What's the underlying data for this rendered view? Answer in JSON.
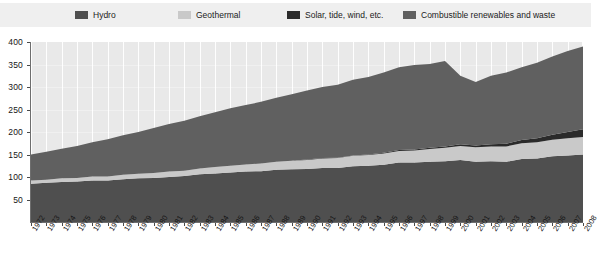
{
  "legend": {
    "items": [
      {
        "label": "Hydro",
        "color": "#4f4f4f",
        "swatch_name": "legend-swatch-hydro"
      },
      {
        "label": "Geothermal",
        "color": "#c9c9c9",
        "swatch_name": "legend-swatch-geothermal"
      },
      {
        "label": "Solar, tide, wind, etc.",
        "color": "#2b2b2b",
        "swatch_name": "legend-swatch-solar"
      },
      {
        "label": "Combustible renewables and waste",
        "color": "#606060",
        "swatch_name": "legend-swatch-combustible"
      }
    ]
  },
  "chart_data": {
    "type": "area",
    "title": "",
    "xlabel": "",
    "ylabel": "",
    "ylim": [
      0,
      400
    ],
    "yticks": [
      0,
      50,
      100,
      150,
      200,
      250,
      300,
      350,
      400
    ],
    "ytick_labels": [
      "",
      "50",
      "100",
      "150",
      "200",
      "250",
      "300",
      "350",
      "400"
    ],
    "grid": true,
    "legend_position": "top",
    "stacked": true,
    "categories": [
      "1972",
      "1973",
      "1974",
      "1975",
      "1976",
      "1977",
      "1978",
      "1979",
      "1980",
      "1981",
      "1982",
      "1983",
      "1984",
      "1985",
      "1986",
      "1987",
      "1988",
      "1989",
      "1990",
      "1991",
      "1992",
      "1993",
      "1994",
      "1995",
      "1996",
      "1997",
      "1998",
      "1999",
      "2000",
      "2001",
      "2002",
      "2003",
      "2004",
      "2005",
      "2006",
      "2007",
      "2008"
    ],
    "series": [
      {
        "name": "Hydro",
        "color": "#4f4f4f",
        "values": [
          85,
          87,
          89,
          90,
          92,
          92,
          95,
          97,
          98,
          100,
          102,
          106,
          108,
          110,
          112,
          113,
          116,
          117,
          118,
          120,
          120,
          124,
          125,
          127,
          132,
          132,
          134,
          135,
          138,
          134,
          135,
          134,
          140,
          141,
          146,
          148,
          150
        ]
      },
      {
        "name": "Geothermal",
        "color": "#c9c9c9",
        "values": [
          7,
          7,
          8,
          8,
          9,
          9,
          10,
          10,
          11,
          12,
          12,
          13,
          14,
          15,
          16,
          17,
          18,
          19,
          20,
          21,
          22,
          23,
          24,
          25,
          26,
          27,
          28,
          30,
          31,
          32,
          33,
          34,
          35,
          36,
          37,
          38,
          39
        ]
      },
      {
        "name": "Solar, tide, wind, etc.",
        "color": "#2b2b2b",
        "values": [
          0,
          0,
          0,
          0,
          0,
          0,
          0,
          0,
          0,
          0,
          0,
          0,
          0,
          0,
          0,
          0,
          0,
          0,
          1,
          1,
          1,
          1,
          1,
          2,
          2,
          2,
          3,
          3,
          4,
          4,
          5,
          6,
          7,
          9,
          11,
          14,
          17
        ]
      },
      {
        "name": "Combustible renewables and waste",
        "color": "#606060",
        "values": [
          58,
          62,
          66,
          71,
          76,
          83,
          88,
          93,
          100,
          106,
          111,
          116,
          122,
          128,
          132,
          137,
          142,
          148,
          153,
          158,
          162,
          168,
          172,
          178,
          184,
          188,
          186,
          190,
          152,
          141,
          152,
          158,
          162,
          168,
          174,
          180,
          184
        ]
      }
    ],
    "totals": [
      150,
      156,
      163,
      169,
      177,
      184,
      193,
      200,
      209,
      218,
      225,
      235,
      244,
      253,
      260,
      267,
      276,
      284,
      292,
      300,
      305,
      316,
      322,
      332,
      344,
      349,
      351,
      358,
      325,
      311,
      325,
      332,
      344,
      354,
      368,
      380,
      390
    ]
  }
}
